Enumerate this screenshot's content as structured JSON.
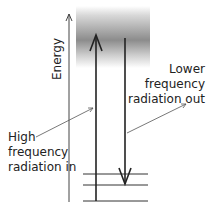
{
  "diagram": {
    "axis_label": "Energy",
    "labels": {
      "lower": [
        "Lower",
        "frequency",
        "radiation out"
      ],
      "higher": [
        "High",
        "frequency",
        "radiation in"
      ]
    },
    "energy_levels_count": 3,
    "colors": {
      "line": "#222222",
      "band_dark": "#8c8c8c",
      "band_light": "#ffffff"
    }
  }
}
